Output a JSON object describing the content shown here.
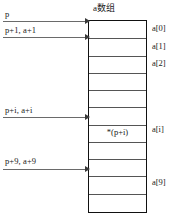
{
  "diagram": {
    "title": "a数组",
    "array": {
      "cell_count": 11,
      "cell_contents": [
        {
          "index": 6,
          "text": "*(p+i)"
        }
      ]
    },
    "pointer_labels": [
      {
        "id": "p",
        "text": "p",
        "label_y": 9,
        "line_y": 21
      },
      {
        "id": "p1",
        "text": "p+1, a+1",
        "label_y": 25,
        "line_y": 37
      },
      {
        "id": "pi",
        "text": "p+i, a+i",
        "label_y": 105,
        "line_y": 117
      },
      {
        "id": "p9",
        "text": "p+9, a+9",
        "label_y": 156,
        "line_y": 169
      }
    ],
    "index_labels": [
      {
        "id": "a0",
        "text": "a[0]",
        "y": 23
      },
      {
        "id": "a1",
        "text": "a[1]",
        "y": 41
      },
      {
        "id": "a2",
        "text": "a[2]",
        "y": 58
      },
      {
        "id": "ai",
        "text": "a[i]",
        "y": 124
      },
      {
        "id": "a9",
        "text": "a[9]",
        "y": 177
      }
    ],
    "colors": {
      "box_border": "#111111",
      "divider": "#555555",
      "arrow": "#6a6a6a",
      "text": "#1a1a1a",
      "background": "#ffffff"
    }
  }
}
